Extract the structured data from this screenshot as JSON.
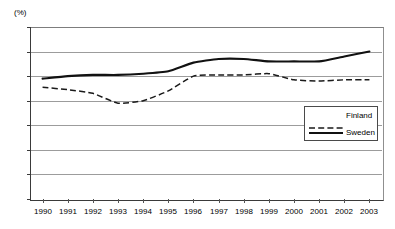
{
  "chart_data": {
    "type": "line",
    "title": "",
    "xlabel": "",
    "ylabel": "(%)",
    "yunit_label": "(%)",
    "x": [
      1990,
      1991,
      1992,
      1993,
      1994,
      1995,
      1996,
      1997,
      1998,
      1999,
      2000,
      2001,
      2002,
      2003
    ],
    "categories": [
      "1990",
      "1991",
      "1992",
      "1993",
      "1994",
      "1995",
      "1996",
      "1997",
      "1998",
      "1999",
      "2000",
      "2001",
      "2002",
      "2003"
    ],
    "ylim": [
      0,
      70
    ],
    "yticks": [
      0,
      10,
      20,
      30,
      40,
      50,
      60,
      70
    ],
    "ytick_labels": [
      "0",
      "10",
      "20",
      "30",
      "40",
      "50",
      "60",
      "70"
    ],
    "grid": true,
    "grid_axis": "y",
    "legend_position": "right-middle",
    "series": [
      {
        "name": "Finland",
        "style": "dashed",
        "color": "#1a1a1a",
        "values": [
          45.5,
          44.5,
          43.0,
          39.0,
          40.0,
          44.0,
          50.0,
          50.5,
          50.5,
          51.0,
          48.5,
          48.0,
          48.5,
          48.5
        ]
      },
      {
        "name": "Sweden",
        "style": "solid",
        "color": "#111111",
        "values": [
          49.0,
          50.0,
          50.5,
          50.5,
          51.0,
          52.0,
          55.5,
          57.0,
          57.0,
          56.0,
          56.0,
          56.0,
          58.0,
          60.0
        ]
      }
    ]
  },
  "legend": {
    "entries": [
      {
        "label": "Finland"
      },
      {
        "label": "Sweden"
      }
    ]
  }
}
